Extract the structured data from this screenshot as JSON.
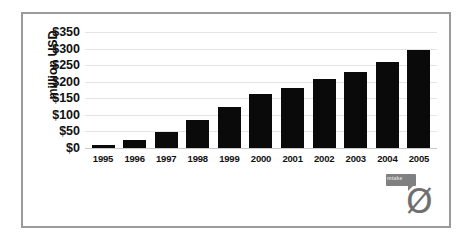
{
  "chart_data": {
    "type": "bar",
    "title": "",
    "subtitle": "",
    "xlabel": "",
    "ylabel": "million USD",
    "categories": [
      "1995",
      "1996",
      "1997",
      "1998",
      "1999",
      "2000",
      "2001",
      "2002",
      "2003",
      "2004",
      "2005"
    ],
    "values": [
      10,
      25,
      48,
      85,
      124,
      163,
      182,
      207,
      228,
      259,
      297
    ],
    "ylim": [
      0,
      350
    ],
    "ytick_values": [
      0,
      50,
      100,
      150,
      200,
      250,
      300,
      350
    ],
    "ytick_labels": [
      "$0",
      "$50",
      "$100",
      "$150",
      "$200",
      "$250",
      "$300",
      "$350"
    ],
    "grid": true,
    "legend": false,
    "legend_position": "none",
    "bar_color": "#0a0a0a",
    "gridline_color": "#e4e4e4",
    "frame_color": "#9a9a9a",
    "background": "#ffffff"
  },
  "logo": {
    "bubble_text": "mtake",
    "mark_glyph": "Ø",
    "color": "#6f6f6f"
  }
}
